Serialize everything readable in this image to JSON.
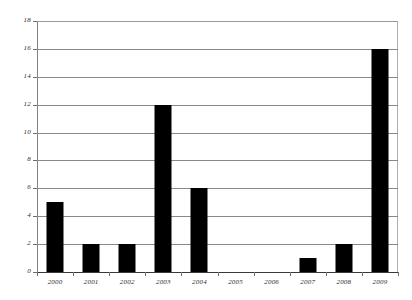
{
  "chart_data": {
    "type": "bar",
    "title": "",
    "subtitle": "",
    "xlabel": "",
    "ylabel": "",
    "categories": [
      "2000",
      "2001",
      "2002",
      "2003",
      "2004",
      "2005",
      "2006",
      "2007",
      "2008",
      "2009"
    ],
    "values": [
      5,
      2,
      2,
      12,
      6,
      0,
      0,
      1,
      2,
      16
    ],
    "series": [
      {
        "name": "",
        "values": [
          5,
          2,
          2,
          12,
          6,
          0,
          0,
          1,
          2,
          16
        ],
        "color": "#000000"
      }
    ],
    "ylim": [
      0,
      18
    ],
    "ytick_values": [
      0,
      2,
      4,
      6,
      8,
      10,
      12,
      14,
      16,
      18
    ],
    "ytick_labels": [
      "0",
      "2",
      "4",
      "6",
      "8",
      "10",
      "12",
      "14",
      "16",
      "18"
    ],
    "ytick_step": 2,
    "xtick_labels": [
      "2000",
      "2001",
      "2002",
      "2003",
      "2004",
      "2005",
      "2006",
      "2007",
      "2008",
      "2009"
    ],
    "grid": {
      "horizontal": true,
      "vertical": false,
      "color": "#8a8a8a"
    },
    "legend": {
      "visible": false,
      "position": "none",
      "entries": []
    },
    "annotations": [],
    "colors": {
      "bar": "#000000",
      "gridline": "#8a8a8a",
      "axis": "#6e6e6e",
      "baseline": "#3a3a3a",
      "background": "#ffffff",
      "tick_label": "#2b2b2b"
    }
  }
}
